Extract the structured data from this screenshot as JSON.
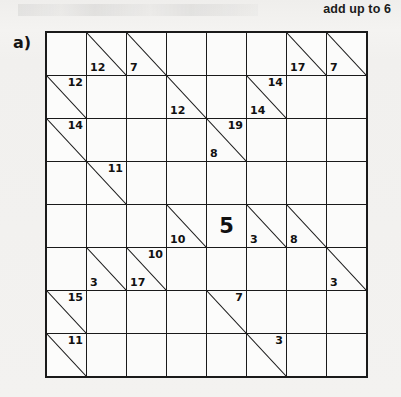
{
  "caption": "add up to 6",
  "panel_label": "a)",
  "colors": {
    "page_background": "#f2f1ef",
    "blocked_cell": "#858585",
    "clue_cell": "#c9c9c7",
    "open_cell": "#fcfcfb",
    "grid_line": "#1a1a1a",
    "text": "#111111"
  },
  "puzzle": {
    "type": "kakuro",
    "rows": 8,
    "cols": 8,
    "cell_size_px": 39,
    "given_values": [
      {
        "row": 5,
        "col": 5,
        "value": "5"
      }
    ],
    "grid": [
      [
        {
          "kind": "blocked"
        },
        {
          "kind": "clue",
          "down": "12"
        },
        {
          "kind": "clue",
          "down": "7"
        },
        {
          "kind": "blocked"
        },
        {
          "kind": "blocked"
        },
        {
          "kind": "blocked"
        },
        {
          "kind": "clue",
          "down": "17"
        },
        {
          "kind": "clue",
          "down": "7"
        }
      ],
      [
        {
          "kind": "clue",
          "across": "12"
        },
        {
          "kind": "open"
        },
        {
          "kind": "open"
        },
        {
          "kind": "clue",
          "down": "12"
        },
        {
          "kind": "blocked"
        },
        {
          "kind": "clue",
          "across": "14",
          "down": "14"
        },
        {
          "kind": "open"
        },
        {
          "kind": "open"
        }
      ],
      [
        {
          "kind": "clue",
          "across": "14"
        },
        {
          "kind": "open"
        },
        {
          "kind": "open"
        },
        {
          "kind": "open"
        },
        {
          "kind": "clue",
          "across": "19",
          "down": "8"
        },
        {
          "kind": "open"
        },
        {
          "kind": "open"
        },
        {
          "kind": "open"
        }
      ],
      [
        {
          "kind": "blocked"
        },
        {
          "kind": "clue",
          "across": "11"
        },
        {
          "kind": "open"
        },
        {
          "kind": "open"
        },
        {
          "kind": "open"
        },
        {
          "kind": "open"
        },
        {
          "kind": "blocked"
        },
        {
          "kind": "blocked"
        }
      ],
      [
        {
          "kind": "blocked"
        },
        {
          "kind": "blocked"
        },
        {
          "kind": "blocked"
        },
        {
          "kind": "clue",
          "down": "10"
        },
        {
          "kind": "given",
          "value": "5"
        },
        {
          "kind": "clue",
          "down": "3"
        },
        {
          "kind": "clue",
          "down": "8"
        },
        {
          "kind": "blocked"
        }
      ],
      [
        {
          "kind": "blocked"
        },
        {
          "kind": "clue",
          "down": "3"
        },
        {
          "kind": "clue",
          "across": "10",
          "down": "17"
        },
        {
          "kind": "open"
        },
        {
          "kind": "open"
        },
        {
          "kind": "open"
        },
        {
          "kind": "open"
        },
        {
          "kind": "clue",
          "down": "3"
        }
      ],
      [
        {
          "kind": "clue",
          "across": "15"
        },
        {
          "kind": "open"
        },
        {
          "kind": "open"
        },
        {
          "kind": "open"
        },
        {
          "kind": "clue",
          "across": "7"
        },
        {
          "kind": "open"
        },
        {
          "kind": "open"
        },
        {
          "kind": "open"
        }
      ],
      [
        {
          "kind": "clue",
          "across": "11"
        },
        {
          "kind": "open"
        },
        {
          "kind": "open"
        },
        {
          "kind": "blocked"
        },
        {
          "kind": "blocked"
        },
        {
          "kind": "clue",
          "across": "3"
        },
        {
          "kind": "open"
        },
        {
          "kind": "open"
        }
      ]
    ]
  }
}
